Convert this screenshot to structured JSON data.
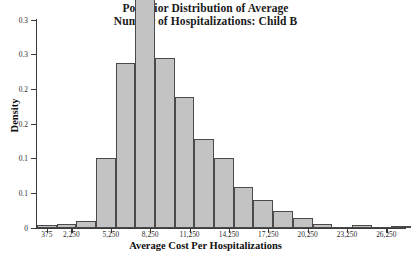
{
  "chart_data": {
    "type": "bar",
    "title": "Posterior Distribution of Average Number of Hospitalizations: Child B",
    "title_line1": "Posterior Distribution of Average",
    "title_line2": "Number of Hospitalizations: Child B",
    "xlabel": "Average Cost Per Hospitalizations",
    "ylabel": "Density",
    "xlim": [
      -375,
      27750
    ],
    "ylim": [
      0,
      0.3
    ],
    "grid": false,
    "legend": null,
    "bin_width": 1500,
    "xtick_labels": [
      "375",
      "2,250",
      "5,250",
      "8,250",
      "11,250",
      "14,250",
      "17,250",
      "20,250",
      "23,250",
      "26,250"
    ],
    "xtick_values": [
      375,
      2250,
      5250,
      8250,
      11250,
      14250,
      17250,
      20250,
      23250,
      26250
    ],
    "ytick_labels": [
      "0",
      "0.1",
      "0.1",
      "0.2",
      "0.2",
      "0.3",
      "0.3"
    ],
    "ytick_values": [
      0,
      0.05,
      0.1,
      0.15,
      0.2,
      0.25,
      0.3
    ],
    "bar_fill_color": "#c3c3c3",
    "bar_edge_color": "#4a4a4a",
    "axis_color": "#3a3a3a",
    "bins": [
      {
        "x": 375,
        "value": 0.004
      },
      {
        "x": 1875,
        "value": 0.006
      },
      {
        "x": 3375,
        "value": 0.01
      },
      {
        "x": 4875,
        "value": 0.101
      },
      {
        "x": 6375,
        "value": 0.238
      },
      {
        "x": 7875,
        "value": 0.339
      },
      {
        "x": 9375,
        "value": 0.245
      },
      {
        "x": 10875,
        "value": 0.189
      },
      {
        "x": 12375,
        "value": 0.129
      },
      {
        "x": 13875,
        "value": 0.101
      },
      {
        "x": 15375,
        "value": 0.059
      },
      {
        "x": 16875,
        "value": 0.04
      },
      {
        "x": 18375,
        "value": 0.024
      },
      {
        "x": 19875,
        "value": 0.015
      },
      {
        "x": 21375,
        "value": 0.006
      },
      {
        "x": 22875,
        "value": 0.0
      },
      {
        "x": 24375,
        "value": 0.005
      },
      {
        "x": 25875,
        "value": 0.0
      },
      {
        "x": 27375,
        "value": 0.002
      }
    ]
  }
}
